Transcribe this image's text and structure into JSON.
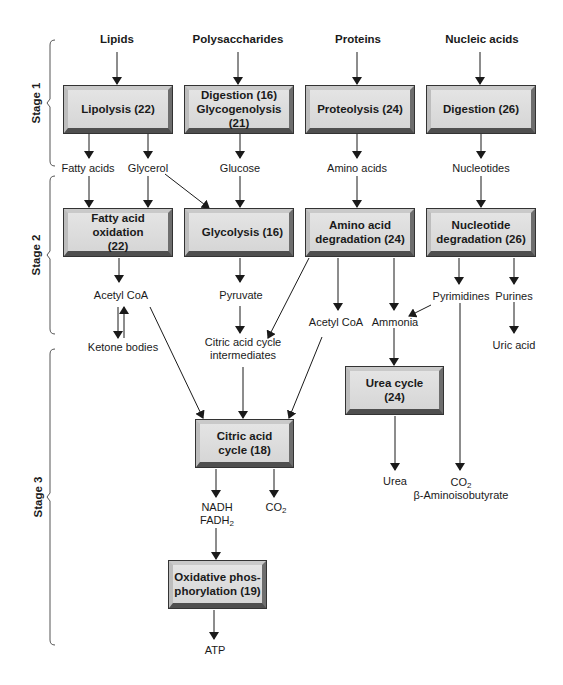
{
  "stages": [
    {
      "label": "Stage 1"
    },
    {
      "label": "Stage 2"
    },
    {
      "label": "Stage 3"
    }
  ],
  "sources": {
    "lipids": "Lipids",
    "polysaccharides": "Polysaccharides",
    "proteins": "Proteins",
    "nucleic_acids": "Nucleic acids"
  },
  "processes": {
    "lipolysis": "Lipolysis (22)",
    "digestion_16": "Digestion (16)",
    "glycogenolysis": "Glycogenolysis (21)",
    "proteolysis": "Proteolysis (24)",
    "digestion_26": "Digestion (26)",
    "fatty_acid_oxidation_1": "Fatty acid oxidation",
    "fatty_acid_oxidation_2": "(22)",
    "glycolysis": "Glycolysis (16)",
    "amino_acid_degradation_1": "Amino acid",
    "amino_acid_degradation_2": "degradation (24)",
    "nucleotide_degradation_1": "Nucleotide",
    "nucleotide_degradation_2": "degradation (26)",
    "urea_cycle_1": "Urea cycle",
    "urea_cycle_2": "(24)",
    "citric_acid_cycle_1": "Citric acid",
    "citric_acid_cycle_2": "cycle (18)",
    "oxidative_phos_1": "Oxidative phos-",
    "oxidative_phos_2": "phorylation (19)"
  },
  "intermediates": {
    "fatty_acids": "Fatty acids",
    "glycerol": "Glycerol",
    "glucose": "Glucose",
    "amino_acids": "Amino acids",
    "nucleotides": "Nucleotides",
    "acetyl_coa_left": "Acetyl CoA",
    "ketone_bodies": "Ketone bodies",
    "pyruvate": "Pyruvate",
    "cac_intermediates_1": "Citric acid cycle",
    "cac_intermediates_2": "intermediates",
    "acetyl_coa_right": "Acetyl CoA",
    "ammonia": "Ammonia",
    "pyrimidines": "Pyrimidines",
    "purines": "Purines",
    "uric_acid": "Uric acid",
    "urea": "Urea",
    "co2_pyrimidine": "CO",
    "co2_pyrimidine_sub": "2",
    "beta_aminoisobutyrate": "β-Aminoisobutyrate",
    "nadh": "NADH",
    "fadh": "FADH",
    "fadh_sub": "2",
    "co2_cac": "CO",
    "co2_cac_sub": "2",
    "atp": "ATP"
  },
  "colors": {
    "box_fill": "#dcdcdc",
    "box_shadow": "#4f4f4f",
    "line": "#1a1a1a"
  }
}
